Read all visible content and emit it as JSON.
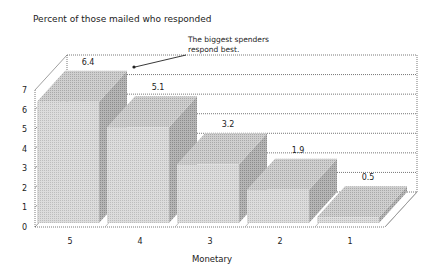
{
  "chart_data": {
    "type": "bar",
    "title": "Percent of those mailed who responded",
    "xlabel": "Monetary",
    "ylabel": "Percent of those mailed who responded",
    "categories": [
      "5",
      "4",
      "3",
      "2",
      "1"
    ],
    "values": [
      6.4,
      5.1,
      3.2,
      1.9,
      0.5
    ],
    "data_labels": [
      "6.4",
      "5.1",
      "3.2",
      "1.9",
      "0.5"
    ],
    "ylim": [
      0,
      7
    ],
    "yticks": [
      "0",
      "1",
      "2",
      "3",
      "4",
      "5",
      "6",
      "7"
    ],
    "grid": true,
    "style": "3d",
    "annotation": {
      "line1": "The biggest spenders",
      "line2": "respond best.",
      "points_to": "5"
    },
    "legend": null
  },
  "colors": {
    "bar_front": "#d4d4d4",
    "bar_top": "#c4c4c4",
    "bar_side": "#a8a8a8",
    "grid": "#555555",
    "text": "#222222"
  }
}
